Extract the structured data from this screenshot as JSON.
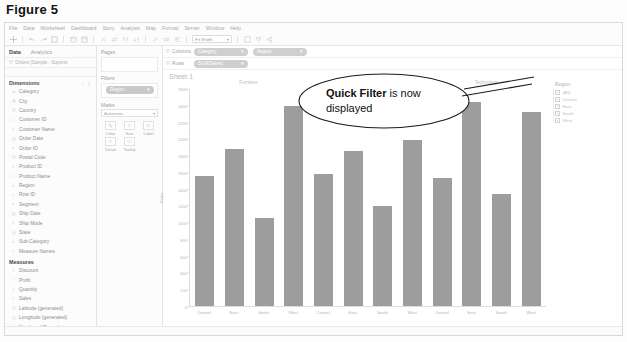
{
  "figure": {
    "caption": "Figure 5"
  },
  "menubar": {
    "items": [
      "File",
      "Data",
      "Worksheet",
      "Dashboard",
      "Story",
      "Analysis",
      "Map",
      "Format",
      "Server",
      "Window",
      "Help"
    ]
  },
  "toolbar": {
    "fit_value": "Fit Width",
    "show_me_label": "Show Me"
  },
  "data_pane": {
    "tab_data": "Data",
    "tab_analytics": "Analytics",
    "source": "Orders (Sample - Superst",
    "dimensions_label": "Dimensions",
    "measures_label": "Measures",
    "dimensions": [
      {
        "label": "Category",
        "type": "text"
      },
      {
        "label": "City",
        "type": "geo"
      },
      {
        "label": "Country",
        "type": "geo"
      },
      {
        "label": "Customer ID",
        "type": "text"
      },
      {
        "label": "Customer Name",
        "type": "text"
      },
      {
        "label": "Order Date",
        "type": "date"
      },
      {
        "label": "Order ID",
        "type": "text"
      },
      {
        "label": "Postal Code",
        "type": "geo"
      },
      {
        "label": "Product ID",
        "type": "text"
      },
      {
        "label": "Product Name",
        "type": "text"
      },
      {
        "label": "Region",
        "type": "text"
      },
      {
        "label": "Row ID",
        "type": "text"
      },
      {
        "label": "Segment",
        "type": "text"
      },
      {
        "label": "Ship Date",
        "type": "date"
      },
      {
        "label": "Ship Mode",
        "type": "text"
      },
      {
        "label": "State",
        "type": "geo"
      },
      {
        "label": "Sub-Category",
        "type": "text"
      },
      {
        "label": "Measure Names",
        "type": "text"
      }
    ],
    "measures": [
      {
        "label": "Discount",
        "type": "num"
      },
      {
        "label": "Profit",
        "type": "num"
      },
      {
        "label": "Quantity",
        "type": "num"
      },
      {
        "label": "Sales",
        "type": "num"
      },
      {
        "label": "Latitude (generated)",
        "type": "geo"
      },
      {
        "label": "Longitude (generated)",
        "type": "geo"
      },
      {
        "label": "Number of Records",
        "type": "num"
      },
      {
        "label": "Measure Values",
        "type": "num"
      }
    ]
  },
  "cards": {
    "pages_label": "Pages",
    "filters_label": "Filters",
    "filter_pills": [
      "Region"
    ],
    "marks_label": "Marks",
    "marks_type": "Automatic",
    "mark_buttons": [
      {
        "label": "Color",
        "icon": "color-icon"
      },
      {
        "label": "Size",
        "icon": "size-icon"
      },
      {
        "label": "Label",
        "icon": "label-icon"
      },
      {
        "label": "Detail",
        "icon": "detail-icon"
      },
      {
        "label": "Tooltip",
        "icon": "tooltip-icon"
      }
    ]
  },
  "shelves": {
    "columns_label": "Columns",
    "rows_label": "Rows",
    "columns_pills": [
      "Category",
      "Region"
    ],
    "rows_pills": [
      "SUM(Sales)"
    ]
  },
  "worksheet": {
    "title": "Sheet 1"
  },
  "quick_filter": {
    "title": "Region",
    "items": [
      {
        "label": "(All)",
        "checked": true
      },
      {
        "label": "Central",
        "checked": true
      },
      {
        "label": "East",
        "checked": true
      },
      {
        "label": "South",
        "checked": true
      },
      {
        "label": "West",
        "checked": true
      }
    ]
  },
  "callout": {
    "bold_text": "Quick Filter",
    "rest_text": " is now displayed"
  },
  "chart_data": {
    "type": "bar",
    "title": "",
    "xlabel": "",
    "ylabel": "Sales",
    "grid": false,
    "legend": "none",
    "ylim": [
      0,
      2600
    ],
    "yticks": [
      0,
      200,
      400,
      600,
      800,
      1000,
      1200,
      1400,
      1600,
      1800,
      2000,
      2200,
      2400,
      2600
    ],
    "ytick_labels": [
      "0",
      "200",
      "400",
      "600",
      "800",
      "1000",
      "1200",
      "1400",
      "1600",
      "1800",
      "2000",
      "2200",
      "2400",
      "2600"
    ],
    "group_labels": [
      "Furniture",
      "Office Supplies",
      "Technology"
    ],
    "categories": [
      "Central",
      "East",
      "South",
      "West",
      "Central",
      "East",
      "South",
      "West",
      "Central",
      "East",
      "South",
      "West"
    ],
    "values": [
      1560,
      1880,
      1050,
      2400,
      1580,
      1860,
      1200,
      1990,
      1530,
      2450,
      1340,
      2330
    ],
    "bar_color": "#9d9d9d"
  }
}
